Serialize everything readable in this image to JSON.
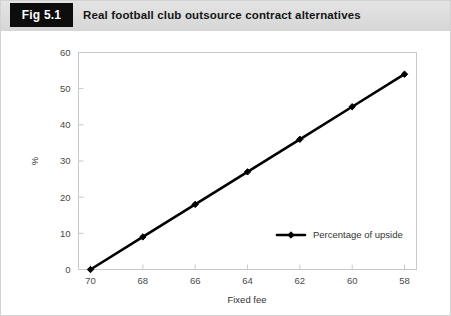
{
  "figure": {
    "tag_label": "Fig 5.1",
    "title": "Real football club outsource contract alternatives"
  },
  "chart_data": {
    "type": "line",
    "title": "Real football club outsource contract alternatives",
    "xlabel": "Fixed fee",
    "ylabel": "%",
    "categories": [
      70,
      68,
      66,
      64,
      62,
      60,
      58
    ],
    "x_tick_labels": [
      "70",
      "68",
      "66",
      "64",
      "62",
      "60",
      "58"
    ],
    "y_tick_labels": [
      "0",
      "10",
      "20",
      "30",
      "40",
      "50",
      "60"
    ],
    "y_ticks": [
      0,
      10,
      20,
      30,
      40,
      50,
      60
    ],
    "xlim": [
      70,
      58
    ],
    "ylim": [
      0,
      60
    ],
    "x_axis_direction": "descending",
    "grid": false,
    "legend_position": "inside-lower-right",
    "series": [
      {
        "name": "Percentage of upside",
        "values": [
          0,
          9,
          18,
          27,
          36,
          45,
          54
        ],
        "color": "#000000",
        "marker": "diamond"
      }
    ]
  },
  "legend": {
    "entries": [
      {
        "label": "Percentage of upside"
      }
    ]
  }
}
